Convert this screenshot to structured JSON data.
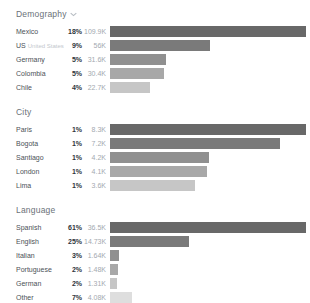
{
  "panel_title": "audience-demographics-panel",
  "style": {
    "background": "#ffffff",
    "bar_palette": [
      "#686868",
      "#7a7a7a",
      "#909090",
      "#a8a8a8",
      "#c6c6c6",
      "#dedede"
    ],
    "title_color": "#6a7178",
    "label_color": "#4b5157",
    "percent_color": "#2f353b",
    "value_color": "#a3a9b0"
  },
  "chart_data": [
    {
      "type": "bar",
      "title": "Demography",
      "has_caret": true,
      "legend_position": "none",
      "grid": false,
      "categories": [
        "Mexico",
        "US",
        "Germany",
        "Colombia",
        "Chile"
      ],
      "sublabels": [
        "",
        "United States",
        "",
        "",
        ""
      ],
      "percents": [
        "18%",
        "9%",
        "5%",
        "5%",
        "4%"
      ],
      "values": [
        109.9,
        56,
        31.6,
        30.4,
        22.7
      ],
      "value_labels": [
        "109.9K",
        "56K",
        "31.6K",
        "30.4K",
        "22.7K"
      ],
      "xlim": [
        0,
        109.9
      ],
      "unit": "K"
    },
    {
      "type": "bar",
      "title": "City",
      "has_caret": false,
      "legend_position": "none",
      "grid": false,
      "categories": [
        "Paris",
        "Bogota",
        "Santiago",
        "London",
        "Lima"
      ],
      "sublabels": [
        "",
        "",
        "",
        "",
        ""
      ],
      "percents": [
        "1%",
        "1%",
        "1%",
        "1%",
        "1%"
      ],
      "values": [
        8.3,
        7.2,
        4.2,
        4.1,
        3.6
      ],
      "value_labels": [
        "8.3K",
        "7.2K",
        "4.2K",
        "4.1K",
        "3.6K"
      ],
      "xlim": [
        0,
        8.3
      ],
      "unit": "K"
    },
    {
      "type": "bar",
      "title": "Language",
      "has_caret": false,
      "legend_position": "none",
      "grid": false,
      "categories": [
        "Spanish",
        "English",
        "Italian",
        "Portuguese",
        "German",
        "Other"
      ],
      "sublabels": [
        "",
        "",
        "",
        "",
        "",
        ""
      ],
      "percents": [
        "61%",
        "25%",
        "3%",
        "2%",
        "2%",
        "7%"
      ],
      "values": [
        36.5,
        14.73,
        1.64,
        1.48,
        1.31,
        4.08
      ],
      "value_labels": [
        "36.5K",
        "14.73K",
        "1.64K",
        "1.48K",
        "1.31K",
        "4.08K"
      ],
      "xlim": [
        0,
        36.5
      ],
      "unit": "K"
    }
  ]
}
